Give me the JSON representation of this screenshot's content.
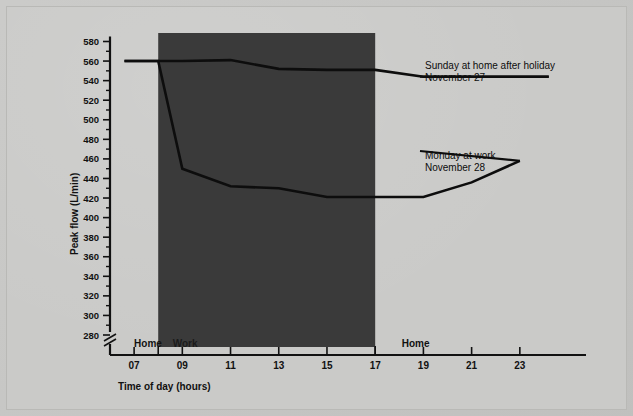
{
  "figure": {
    "background_color": "#c8c8c6",
    "ink_color": "#0d0d0d",
    "shade_color": "#3a3a3a"
  },
  "chart_data": {
    "type": "line",
    "title": "",
    "xlabel": "Time of day (hours)",
    "ylabel": "Peak flow (L/min)",
    "xlim": [
      6,
      24.5
    ],
    "ylim": [
      270,
      585
    ],
    "grid": false,
    "axis_break": true,
    "legend_position": "inline-annotations",
    "x_ticks": [
      7,
      9,
      11,
      13,
      15,
      17,
      19,
      21,
      23
    ],
    "x_tick_labels": [
      "07",
      "09",
      "11",
      "13",
      "15",
      "17",
      "19",
      "21",
      "23"
    ],
    "y_ticks": [
      280,
      300,
      320,
      340,
      360,
      380,
      400,
      420,
      440,
      460,
      480,
      500,
      520,
      540,
      560,
      580
    ],
    "y_tick_labels": [
      "280",
      "300",
      "320",
      "340",
      "360",
      "380",
      "400",
      "420",
      "440",
      "460",
      "480",
      "500",
      "520",
      "540",
      "560",
      "580"
    ],
    "shaded_region": {
      "label": "Work",
      "x_start": 8,
      "x_end": 17
    },
    "zone_labels": [
      {
        "text": "Home",
        "x": 7.0,
        "on_dark": false
      },
      {
        "text": "Work",
        "x": 8.6,
        "on_dark": true
      },
      {
        "text": "Home",
        "x": 18.1,
        "on_dark": false
      }
    ],
    "series": [
      {
        "name": "Sunday at home after holiday",
        "date": "November 27",
        "annotation_line1": "Sunday at home after holiday",
        "annotation_line2": "November 27",
        "x": [
          6.6,
          8.0,
          9.0,
          11.0,
          13.0,
          15.0,
          17.0,
          19.0,
          21.0,
          23.0,
          24.2
        ],
        "values": [
          560,
          560,
          560,
          561,
          552,
          551,
          551,
          544,
          544,
          544,
          544
        ]
      },
      {
        "name": "Monday at work",
        "date": "November 28",
        "annotation_line1": "Monday at work",
        "annotation_line2": "November 28",
        "x": [
          6.6,
          8.0,
          9.0,
          11.0,
          13.0,
          15.0,
          17.0,
          19.0,
          21.0,
          23.0
        ],
        "values": [
          560,
          560,
          450,
          432,
          430,
          421,
          421,
          421,
          436,
          458
        ]
      }
    ]
  }
}
